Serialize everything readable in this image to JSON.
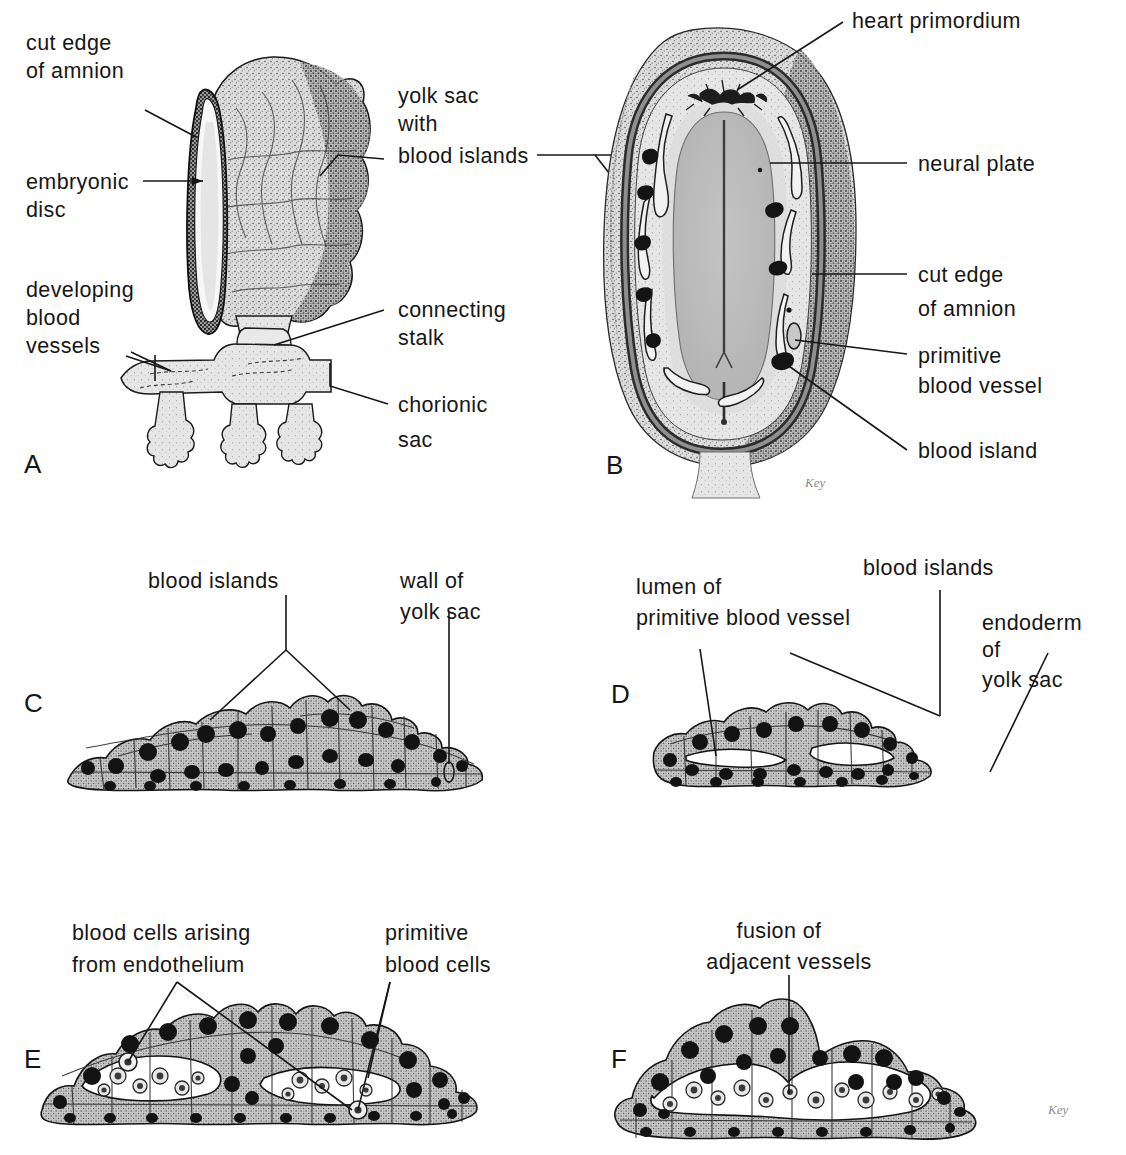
{
  "figure": {
    "background_color": "#ffffff",
    "ink_color": "#161616",
    "tissue_fill": "#d9d9d9",
    "nucleus_color": "#151515"
  },
  "panels": [
    {
      "id": "A",
      "letter": "A",
      "caption": "Embryo with yolk sac, connecting stalk and chorionic sac",
      "labels": [
        {
          "key": "cut_edge_of_amnion",
          "lines": [
            "cut edge",
            "of amnion"
          ]
        },
        {
          "key": "embryonic_disc",
          "lines": [
            "embryonic",
            "disc"
          ]
        },
        {
          "key": "developing_blood_vessels",
          "lines": [
            "developing",
            "blood",
            "vessels"
          ]
        },
        {
          "key": "yolk_sac_with_blood_islands",
          "lines": [
            "yolk sac",
            "with",
            "blood islands"
          ]
        },
        {
          "key": "connecting_stalk",
          "lines": [
            "connecting",
            "stalk"
          ]
        },
        {
          "key": "chorionic_sac",
          "lines": [
            "chorionic",
            "sac"
          ]
        }
      ]
    },
    {
      "id": "B",
      "letter": "B",
      "caption": "Dorsal view of embryonic disc exposed by removal of amnion",
      "labels": [
        {
          "key": "heart_primordium",
          "lines": [
            "heart primordium"
          ]
        },
        {
          "key": "neural_plate",
          "lines": [
            "neural plate"
          ]
        },
        {
          "key": "cut_edge_of_amnion",
          "lines": [
            "cut  edge",
            "of amnion"
          ]
        },
        {
          "key": "primitive_blood_vessel",
          "lines": [
            "primitive",
            "blood vessel"
          ]
        },
        {
          "key": "blood_island",
          "lines": [
            "blood island"
          ]
        }
      ]
    },
    {
      "id": "C",
      "letter": "C",
      "caption": "Blood islands in the wall of the yolk sac",
      "labels": [
        {
          "key": "blood_islands",
          "lines": [
            "blood islands"
          ]
        },
        {
          "key": "wall_of_yolk_sac",
          "lines": [
            "wall of",
            "yolk sac"
          ]
        }
      ]
    },
    {
      "id": "D",
      "letter": "D",
      "caption": "Cavitation of blood islands forming primitive blood vessels",
      "labels": [
        {
          "key": "lumen_of_primitive_blood_vessel",
          "lines": [
            "lumen of",
            "primitive blood vessel"
          ]
        },
        {
          "key": "blood_islands",
          "lines": [
            "blood islands"
          ]
        },
        {
          "key": "endoderm_of_yolk_sac",
          "lines": [
            "endoderm",
            "of",
            "yolk sac"
          ]
        }
      ]
    },
    {
      "id": "E",
      "letter": "E",
      "caption": "Primitive blood cells arising from the endothelium",
      "labels": [
        {
          "key": "blood_cells_arising_from_endothelium",
          "lines": [
            "blood cells arising",
            "from  endothelium"
          ]
        },
        {
          "key": "primitive_blood_cells",
          "lines": [
            "primitive",
            "blood cells"
          ]
        }
      ]
    },
    {
      "id": "F",
      "letter": "F",
      "caption": "Fusion of adjacent endothelium-lined vessels",
      "labels": [
        {
          "key": "fusion_of_adjacent_vessels",
          "lines": [
            "fusion of",
            "adjacent vessels"
          ]
        }
      ]
    }
  ],
  "signature": "Key"
}
